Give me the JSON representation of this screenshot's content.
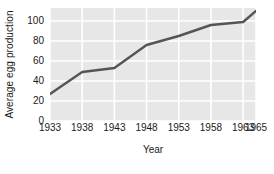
{
  "chart_data": {
    "type": "line",
    "title": "",
    "xlabel": "Year",
    "ylabel": "Average egg production",
    "x": [
      1933,
      1938,
      1943,
      1948,
      1953,
      1958,
      1963,
      1965
    ],
    "values": [
      27,
      49,
      53,
      76,
      85,
      96,
      99,
      110
    ],
    "series": [
      {
        "name": "Average egg production",
        "values": [
          27,
          49,
          53,
          76,
          85,
          96,
          99,
          110
        ]
      }
    ],
    "xtick_labels": [
      "1933",
      "1938",
      "1943",
      "1948",
      "1953",
      "1958",
      "1963",
      "1965"
    ],
    "xtick_values": [
      1933,
      1938,
      1943,
      1948,
      1953,
      1958,
      1963,
      1965
    ],
    "ytick_labels": [
      "0",
      "20",
      "40",
      "60",
      "80",
      "100"
    ],
    "ytick_values": [
      0,
      20,
      40,
      60,
      80,
      100
    ],
    "xlim": [
      1933,
      1965
    ],
    "ylim": [
      0,
      113
    ],
    "grid": true,
    "legend": false,
    "line_color": "#555555",
    "grid_color": "#ffffff",
    "panel_color": "#e7e7e7",
    "figure_color": "#ffffff",
    "text_color": "#1a1a1a",
    "markers": false,
    "line_width": 2.4
  }
}
